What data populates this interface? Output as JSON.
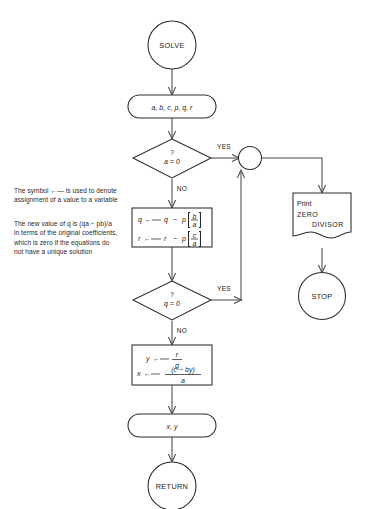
{
  "diagram": {
    "type": "flowchart",
    "background": "#ffffff",
    "line_color": "#2b2b2b",
    "text_color": "#1a1a1a",
    "nodes": {
      "start": {
        "label": "SOLVE",
        "shape": "circle"
      },
      "input": {
        "label": "a, b, c, p, q, r",
        "shape": "stadium"
      },
      "decision_a": {
        "question_mark": "?",
        "label": "a = 0",
        "shape": "diamond"
      },
      "connector": {
        "label": "",
        "shape": "circle-connector"
      },
      "print": {
        "line1": "Print",
        "line2": "ZERO",
        "line3": "DIVISOR",
        "shape": "document"
      },
      "stop": {
        "label": "STOP",
        "shape": "circle"
      },
      "process_1": {
        "shape": "rect",
        "row1": {
          "lhs": "q",
          "arrow": "←",
          "rhs1": "q",
          "op": "−",
          "rhs2": "p",
          "num": "b",
          "den": "a"
        },
        "row2": {
          "lhs": "r",
          "arrow": "←",
          "rhs1": "r",
          "op": "−",
          "rhs2": "p",
          "num": "c",
          "den": "a"
        }
      },
      "decision_q": {
        "question_mark": "?",
        "label": "q = 0",
        "shape": "diamond"
      },
      "process_2": {
        "shape": "rect",
        "row1": {
          "lhs": "y",
          "arrow": "←",
          "num": "r",
          "den": "q"
        },
        "row2": {
          "lhs": "x",
          "arrow": "←",
          "num": "(c − by)",
          "den": "a"
        }
      },
      "output": {
        "label": "x, y",
        "shape": "stadium"
      },
      "return": {
        "label": "RETURN",
        "shape": "circle"
      }
    },
    "edge_labels": {
      "yes_a": "YES",
      "no_a": "NO",
      "yes_q": "YES",
      "no_q": "NO"
    },
    "notes": [
      {
        "id": "assignment-note",
        "text_before": "The symbol",
        "symbol": "←",
        "text_after": "is used to denote assignment of a value to a variable"
      },
      {
        "id": "q-value-note",
        "text": "The new value of q is (qa − pb)/a in terms of the original coefficients, which is zero if the equations do not have a unique solution"
      }
    ]
  }
}
